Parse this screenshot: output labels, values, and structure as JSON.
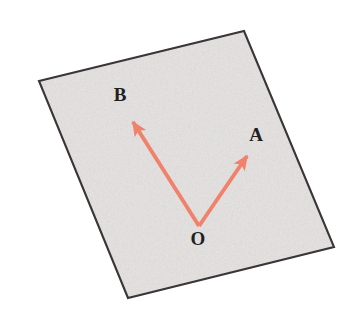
{
  "figure": {
    "type": "vector-diagram",
    "canvas": {
      "width": 359,
      "height": 318,
      "background": "#ffffff"
    },
    "plane": {
      "name": "tilted-paper-sheet",
      "shape": "quadrilateral",
      "fill_color": "#e8e5e4",
      "border_color": "#3a3537",
      "border_width": 2,
      "texture": "speckled-gray-paper",
      "corners": [
        {
          "name": "top-left",
          "x": 39,
          "y": 81
        },
        {
          "name": "top-right",
          "x": 244,
          "y": 31
        },
        {
          "name": "bottom-right",
          "x": 334,
          "y": 247
        },
        {
          "name": "bottom-left",
          "x": 128,
          "y": 298
        }
      ]
    },
    "origin": {
      "name": "O",
      "x": 199,
      "y": 226
    },
    "vectors": [
      {
        "name": "vector-OA",
        "label": "A",
        "color": "#f0816b",
        "line_width": 4,
        "from": {
          "x": 199,
          "y": 226
        },
        "to": {
          "x": 250,
          "y": 151
        },
        "label_position": {
          "x": 256,
          "y": 141
        }
      },
      {
        "name": "vector-OB",
        "label": "B",
        "color": "#f0816b",
        "line_width": 4,
        "from": {
          "x": 199,
          "y": 226
        },
        "to": {
          "x": 130,
          "y": 118
        },
        "label_position": {
          "x": 120,
          "y": 101
        }
      }
    ],
    "labels": [
      {
        "name": "label-B",
        "text": "B",
        "x": 120,
        "y": 101
      },
      {
        "name": "label-A",
        "text": "A",
        "x": 256,
        "y": 141
      },
      {
        "name": "label-O",
        "text": "O",
        "x": 198,
        "y": 245
      }
    ]
  }
}
